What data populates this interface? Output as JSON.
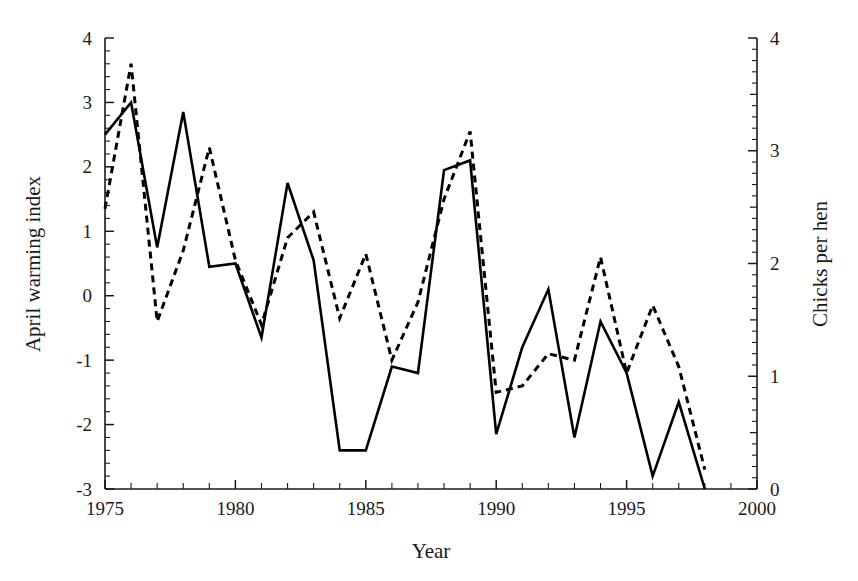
{
  "chart_data": {
    "type": "line",
    "title": "",
    "xlabel": "Year",
    "ylabel": "April warming index",
    "y2label": "Chicks per hen",
    "xlim": [
      1975,
      2000
    ],
    "ylim": [
      -3,
      4
    ],
    "y2lim": [
      0,
      4
    ],
    "grid": false,
    "legend": "none",
    "x_ticks_major": [
      1975,
      1980,
      1985,
      1990,
      1995,
      2000
    ],
    "x_tick_labels": [
      "1975",
      "1980",
      "1985",
      "1990",
      "1995",
      "2000"
    ],
    "x_tick_minor_step": 1,
    "y_ticks_major": [
      -3,
      -2,
      -1,
      0,
      1,
      2,
      3,
      4
    ],
    "y_tick_labels": [
      "-3",
      "-2",
      "-1",
      "0",
      "1",
      "2",
      "3",
      "4"
    ],
    "y_tick_minor_step": 0.2,
    "y2_ticks_major": [
      0,
      1,
      2,
      3,
      4
    ],
    "y2_tick_labels": [
      "0",
      "1",
      "2",
      "3",
      "4"
    ],
    "y2_tick_minor_step": 0.1,
    "x": [
      1975,
      1976,
      1977,
      1978,
      1979,
      1980,
      1981,
      1982,
      1983,
      1984,
      1985,
      1986,
      1987,
      1988,
      1989,
      1990,
      1991,
      1992,
      1993,
      1994,
      1995,
      1996,
      1997,
      1998
    ],
    "series": [
      {
        "name": "April warming index",
        "axis": "left",
        "style": "solid",
        "values": [
          2.5,
          3.0,
          0.75,
          2.85,
          0.45,
          0.5,
          -0.65,
          1.75,
          0.55,
          -2.4,
          -2.4,
          -1.1,
          -1.2,
          1.95,
          2.1,
          -2.15,
          -0.8,
          0.1,
          -2.2,
          -0.4,
          -1.2,
          -2.8,
          -1.65,
          -3.0
        ]
      },
      {
        "name": "Chicks per hen",
        "axis": "right",
        "style": "dashed",
        "values_left_scale": [
          1.35,
          3.6,
          -0.4,
          0.7,
          2.3,
          0.55,
          -0.45,
          0.9,
          1.3,
          -0.35,
          0.65,
          -1.0,
          -0.1,
          1.5,
          2.55,
          -1.5,
          -1.4,
          -0.9,
          -1.0,
          0.6,
          -1.2,
          -0.15,
          -1.1,
          -2.7
        ],
        "values": [
          2.49,
          3.77,
          1.49,
          2.11,
          2.91,
          2.03,
          1.46,
          2.23,
          2.46,
          1.51,
          2.09,
          1.14,
          1.66,
          2.57,
          3.17,
          0.86,
          0.91,
          1.2,
          1.14,
          2.06,
          1.03,
          1.63,
          1.09,
          0.17
        ]
      }
    ]
  },
  "axes": {
    "left_title": "April warming index",
    "right_title": "Chicks per hen",
    "bottom_title": "Year"
  },
  "colors": {
    "line": "#000000",
    "axis": "#1a1a1a",
    "background": "#ffffff"
  }
}
